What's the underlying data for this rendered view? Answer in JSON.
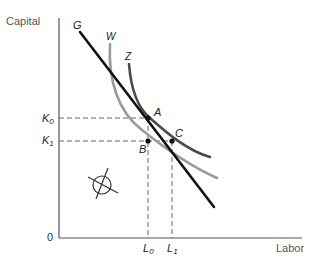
{
  "diagram": {
    "axes": {
      "y_label": "Capital",
      "x_label": "Labor",
      "origin_label": "0"
    },
    "curves": {
      "line_G": {
        "label": "G",
        "color": "#111111"
      },
      "curve_W": {
        "label": "W",
        "color": "#9a9a9a"
      },
      "curve_Z": {
        "label": "Z",
        "color": "#4a4a4a"
      }
    },
    "points": {
      "A": "A",
      "B": "B",
      "C": "C"
    },
    "y_ticks": {
      "K0": {
        "main": "K",
        "sub": "0"
      },
      "K1": {
        "main": "K",
        "sub": "1"
      }
    },
    "x_ticks": {
      "L0": {
        "main": "L",
        "sub": "0"
      },
      "L1": {
        "main": "L",
        "sub": "1"
      }
    },
    "symbol": "circle-with-slash (infeasible/empty set)"
  }
}
